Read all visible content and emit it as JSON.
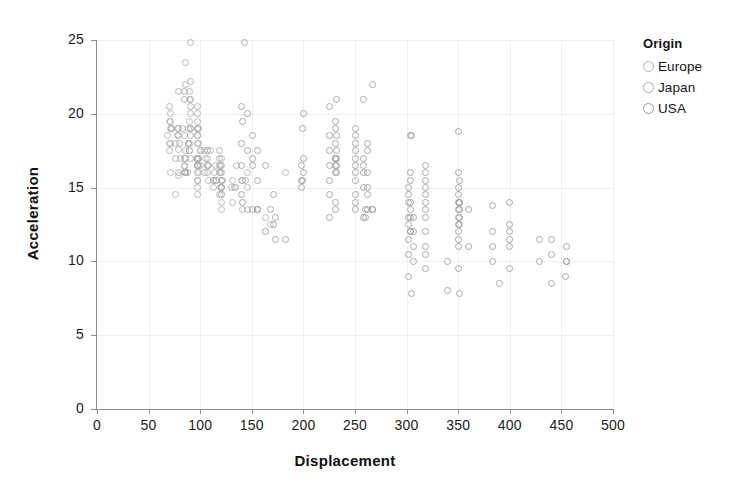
{
  "chart_data": {
    "type": "scatter",
    "title": "",
    "xlabel": "Displacement",
    "ylabel": "Acceleration",
    "xlim": [
      0,
      500
    ],
    "ylim": [
      0,
      25
    ],
    "xticks": [
      0,
      50,
      100,
      150,
      200,
      250,
      300,
      350,
      400,
      450,
      500
    ],
    "yticks": [
      0,
      5,
      10,
      15,
      20,
      25
    ],
    "grid": true,
    "legend": {
      "title": "Origin",
      "position": "right",
      "entries": [
        {
          "name": "Europe",
          "color": "#b0b0b0"
        },
        {
          "name": "Japan",
          "color": "#aaaaaa"
        },
        {
          "name": "USA",
          "color": "#9a9a9a"
        }
      ]
    },
    "series": [
      {
        "name": "Europe",
        "color": "#b0b0b0",
        "points": [
          [
            97,
            20.5
          ],
          [
            97,
            16.0
          ],
          [
            97,
            14.5
          ],
          [
            110,
            17.5
          ],
          [
            107,
            17.5
          ],
          [
            104,
            17.5
          ],
          [
            121,
            14.5
          ],
          [
            116,
            15.5
          ],
          [
            121,
            15.0
          ],
          [
            91,
            19.0
          ],
          [
            79,
            17.6
          ],
          [
            107,
            16.5
          ],
          [
            97,
            20.0
          ],
          [
            97,
            18.5
          ],
          [
            68,
            18.5
          ],
          [
            76,
            14.5
          ],
          [
            98,
            16.0
          ],
          [
            114,
            16.0
          ],
          [
            121,
            13.5
          ],
          [
            121,
            14.5
          ],
          [
            91,
            20.0
          ],
          [
            85,
            16.5
          ],
          [
            70,
            19.5
          ],
          [
            79,
            19.0
          ],
          [
            97,
            19.0
          ],
          [
            90,
            21.0
          ],
          [
            121,
            15.5
          ],
          [
            86,
            16.0
          ],
          [
            79,
            15.8
          ],
          [
            120,
            16.5
          ],
          [
            97,
            15.0
          ],
          [
            131,
            15.5
          ],
          [
            131,
            14.0
          ],
          [
            115,
            15.5
          ],
          [
            78,
            19.0
          ],
          [
            98,
            17.0
          ],
          [
            105,
            17.0
          ],
          [
            85,
            16.0
          ],
          [
            121,
            16.5
          ],
          [
            90,
            21.5
          ],
          [
            133,
            15.0
          ],
          [
            86,
            17.0
          ],
          [
            71,
            16.0
          ],
          [
            89,
            19.0
          ],
          [
            90,
            17.5
          ],
          [
            130,
            15.0
          ],
          [
            121,
            17.0
          ],
          [
            121,
            16.0
          ],
          [
            115,
            16.5
          ],
          [
            141,
            15.5
          ],
          [
            146,
            16.0
          ],
          [
            97,
            16.5
          ],
          [
            107,
            17.0
          ],
          [
            135,
            16.5
          ],
          [
            121,
            15.5
          ],
          [
            98,
            19.0
          ],
          [
            100,
            17.5
          ],
          [
            146,
            15.0
          ],
          [
            121,
            14.0
          ],
          [
            168,
            12.5
          ],
          [
            141,
            13.5
          ],
          [
            163,
            13.0
          ],
          [
            183,
            16.0
          ],
          [
            98,
            17.0
          ],
          [
            120,
            15.0
          ],
          [
            100,
            16.5
          ],
          [
            107,
            17.5
          ],
          [
            89,
            18.0
          ],
          [
            85,
            18.5
          ],
          [
            90,
            19.5
          ]
        ]
      },
      {
        "name": "Japan",
        "color": "#aaaaaa",
        "points": [
          [
            113,
            15.0
          ],
          [
            97,
            15.5
          ],
          [
            97,
            18.5
          ],
          [
            96,
            17.0
          ],
          [
            72,
            19.0
          ],
          [
            72,
            19.0
          ],
          [
            71,
            19.0
          ],
          [
            71,
            18.0
          ],
          [
            79,
            16.0
          ],
          [
            71,
            20.0
          ],
          [
            71,
            19.5
          ],
          [
            97,
            15.5
          ],
          [
            88,
            16.0
          ],
          [
            97,
            16.5
          ],
          [
            70,
            18.0
          ],
          [
            70,
            17.5
          ],
          [
            76,
            17.0
          ],
          [
            83,
            19.0
          ],
          [
            90,
            17.5
          ],
          [
            86,
            17.5
          ],
          [
            86,
            16.0
          ],
          [
            85,
            16.4
          ],
          [
            91,
            18.5
          ],
          [
            97,
            17.0
          ],
          [
            97,
            17.0
          ],
          [
            97,
            19.0
          ],
          [
            78,
            18.5
          ],
          [
            79,
            18.5
          ],
          [
            85,
            17.0
          ],
          [
            81,
            17.0
          ],
          [
            89,
            18.0
          ],
          [
            91,
            17.0
          ],
          [
            107,
            16.5
          ],
          [
            119,
            16.5
          ],
          [
            98,
            16.5
          ],
          [
            97,
            16.5
          ],
          [
            100,
            17.5
          ],
          [
            108,
            15.5
          ],
          [
            119,
            17.5
          ],
          [
            119,
            17.0
          ],
          [
            119,
            14.5
          ],
          [
            119,
            16.0
          ],
          [
            134,
            15.0
          ],
          [
            156,
            13.5
          ],
          [
            91,
            24.8
          ],
          [
            85,
            21.5
          ],
          [
            86,
            22.0
          ],
          [
            86,
            23.5
          ],
          [
            79,
            21.5
          ],
          [
            90,
            18.0
          ],
          [
            97,
            19.5
          ],
          [
            108,
            16.5
          ],
          [
            97,
            18.0
          ],
          [
            86,
            16.0
          ],
          [
            91,
            19.0
          ],
          [
            70,
            20.5
          ],
          [
            80,
            18.0
          ],
          [
            76,
            18.0
          ],
          [
            91,
            21.0
          ],
          [
            91,
            20.5
          ],
          [
            98,
            18.0
          ],
          [
            104,
            16.0
          ],
          [
            107,
            16.0
          ],
          [
            140,
            15.5
          ],
          [
            120,
            16.0
          ],
          [
            122,
            15.5
          ],
          [
            144,
            15.5
          ],
          [
            146,
            13.5
          ],
          [
            91,
            22.2
          ],
          [
            85,
            21.0
          ]
        ]
      },
      {
        "name": "USA",
        "color": "#9a9a9a",
        "points": [
          [
            307,
            12.0
          ],
          [
            350,
            11.5
          ],
          [
            318,
            11.0
          ],
          [
            304,
            12.0
          ],
          [
            302,
            10.5
          ],
          [
            429,
            10.0
          ],
          [
            454,
            9.0
          ],
          [
            440,
            8.5
          ],
          [
            455,
            10.0
          ],
          [
            390,
            8.5
          ],
          [
            383,
            10.0
          ],
          [
            340,
            8.0
          ],
          [
            400,
            9.5
          ],
          [
            455,
            10.0
          ],
          [
            113,
            15.5
          ],
          [
            198,
            15.5
          ],
          [
            199,
            15.5
          ],
          [
            200,
            16.0
          ],
          [
            383,
            11.0
          ],
          [
            340,
            10.0
          ],
          [
            302,
            11.5
          ],
          [
            307,
            11.0
          ],
          [
            318,
            13.5
          ],
          [
            360,
            13.5
          ],
          [
            318,
            16.5
          ],
          [
            318,
            15.5
          ],
          [
            351,
            14.0
          ],
          [
            350,
            14.5
          ],
          [
            400,
            14.0
          ],
          [
            351,
            14.0
          ],
          [
            250,
            14.0
          ],
          [
            258,
            16.0
          ],
          [
            225,
            14.5
          ],
          [
            231,
            14.0
          ],
          [
            262,
            15.0
          ],
          [
            302,
            14.0
          ],
          [
            304,
            13.5
          ],
          [
            250,
            14.5
          ],
          [
            232,
            16.0
          ],
          [
            198,
            15.0
          ],
          [
            232,
            16.5
          ],
          [
            250,
            17.0
          ],
          [
            198,
            16.5
          ],
          [
            232,
            17.5
          ],
          [
            250,
            16.5
          ],
          [
            250,
            18.0
          ],
          [
            258,
            16.5
          ],
          [
            225,
            16.5
          ],
          [
            231,
            16.5
          ],
          [
            262,
            17.5
          ],
          [
            302,
            14.5
          ],
          [
            304,
            14.0
          ],
          [
            250,
            18.5
          ],
          [
            231,
            17.0
          ],
          [
            225,
            15.5
          ],
          [
            262,
            18.0
          ],
          [
            302,
            13.0
          ],
          [
            318,
            13.0
          ],
          [
            350,
            13.5
          ],
          [
            231,
            17.0
          ],
          [
            250,
            17.5
          ],
          [
            258,
            17.0
          ],
          [
            350,
            12.5
          ],
          [
            302,
            12.5
          ],
          [
            304,
            12.0
          ],
          [
            351,
            13.0
          ],
          [
            318,
            12.0
          ],
          [
            350,
            13.0
          ],
          [
            231,
            16.0
          ],
          [
            200,
            17.0
          ],
          [
            225,
            17.5
          ],
          [
            232,
            17.0
          ],
          [
            250,
            16.0
          ],
          [
            262,
            16.0
          ],
          [
            304,
            13.0
          ],
          [
            318,
            14.0
          ],
          [
            350,
            14.0
          ],
          [
            351,
            13.5
          ],
          [
            400,
            12.0
          ],
          [
            400,
            11.5
          ],
          [
            360,
            11.0
          ],
          [
            318,
            10.5
          ],
          [
            350,
            11.0
          ],
          [
            383,
            12.0
          ],
          [
            350,
            12.0
          ],
          [
            351,
            12.5
          ],
          [
            302,
            15.0
          ],
          [
            304,
            15.5
          ],
          [
            307,
            13.0
          ],
          [
            318,
            15.0
          ],
          [
            231,
            18.0
          ],
          [
            225,
            18.5
          ],
          [
            250,
            15.5
          ],
          [
            258,
            15.0
          ],
          [
            262,
            14.5
          ],
          [
            231,
            19.0
          ],
          [
            232,
            18.5
          ],
          [
            250,
            13.5
          ],
          [
            258,
            13.0
          ],
          [
            260,
            13.0
          ],
          [
            267,
            22.0
          ],
          [
            258,
            21.0
          ],
          [
            232,
            21.0
          ],
          [
            225,
            20.5
          ],
          [
            260,
            13.5
          ],
          [
            267,
            13.5
          ],
          [
            231,
            13.5
          ],
          [
            225,
            13.0
          ],
          [
            140,
            14.5
          ],
          [
            156,
            13.5
          ],
          [
            168,
            13.5
          ],
          [
            173,
            13.0
          ],
          [
            183,
            11.5
          ],
          [
            151,
            16.5
          ],
          [
            163,
            16.5
          ],
          [
            171,
            14.5
          ],
          [
            121,
            15.0
          ],
          [
            140,
            16.5
          ],
          [
            146,
            17.5
          ],
          [
            151,
            17.0
          ],
          [
            156,
            15.5
          ],
          [
            141,
            14.0
          ],
          [
            140,
            20.5
          ],
          [
            146,
            20.0
          ],
          [
            141,
            19.5
          ],
          [
            151,
            13.5
          ],
          [
            163,
            12.0
          ],
          [
            173,
            11.5
          ],
          [
            171,
            12.5
          ],
          [
            143,
            24.8
          ],
          [
            151,
            18.5
          ],
          [
            156,
            17.5
          ],
          [
            140,
            18.0
          ],
          [
            200,
            20.0
          ],
          [
            199,
            19.0
          ],
          [
            305,
            18.5
          ],
          [
            305,
            7.8
          ],
          [
            351,
            7.8
          ],
          [
            400,
            12.5
          ],
          [
            350,
            18.8
          ],
          [
            304,
            18.5
          ],
          [
            318,
            9.5
          ],
          [
            350,
            9.5
          ],
          [
            383,
            13.8
          ],
          [
            302,
            9.0
          ],
          [
            307,
            10.0
          ],
          [
            429,
            11.5
          ],
          [
            440,
            11.5
          ],
          [
            455,
            11.0
          ],
          [
            350,
            16.0
          ],
          [
            351,
            15.5
          ],
          [
            318,
            16.0
          ],
          [
            400,
            11.0
          ],
          [
            440,
            10.5
          ],
          [
            304,
            16.0
          ],
          [
            318,
            14.5
          ],
          [
            350,
            15.0
          ],
          [
            231,
            19.5
          ],
          [
            250,
            19.0
          ],
          [
            262,
            13.5
          ],
          [
            267,
            13.5
          ]
        ]
      }
    ]
  }
}
